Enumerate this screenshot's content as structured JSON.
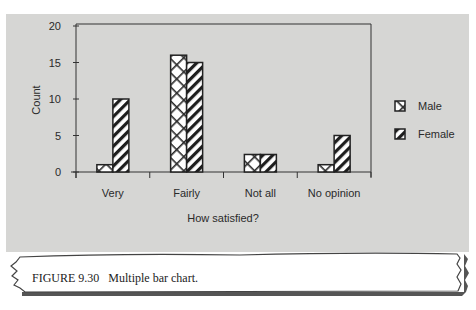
{
  "chart_data": {
    "type": "bar",
    "title": "",
    "xlabel": "How satisfied?",
    "ylabel": "Count",
    "categories": [
      "Very",
      "Fairly",
      "Not all",
      "No opinion"
    ],
    "series": [
      {
        "name": "Male",
        "pattern": "crosshatch",
        "values": [
          1,
          16,
          2.4,
          1
        ]
      },
      {
        "name": "Female",
        "pattern": "diagonal",
        "values": [
          10,
          15,
          2.4,
          5
        ]
      }
    ],
    "ylim": [
      0,
      20
    ],
    "yticks": [
      0,
      5,
      10,
      15,
      20
    ],
    "grid": false,
    "legend_position": "right"
  },
  "legend": {
    "items": [
      {
        "label": "Male"
      },
      {
        "label": "Female"
      }
    ]
  },
  "caption": {
    "figure_number": "FIGURE 9.30",
    "text": "Multiple bar chart."
  },
  "colors": {
    "panel_background": "#d6d6d4",
    "bar_fill": "#ffffff",
    "bar_stroke": "#222222",
    "axis": "#333333"
  }
}
